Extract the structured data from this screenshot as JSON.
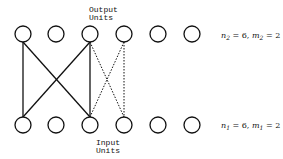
{
  "labels": {
    "output_line1": "Output",
    "output_line2": "Units",
    "input_line1": "Input",
    "input_line2": "Units"
  },
  "equations": {
    "top": {
      "n": "n",
      "n_sub": "2",
      "n_val": " = 6, ",
      "m": "m",
      "m_sub": "2",
      "m_val": " = 2"
    },
    "bottom": {
      "n": "n",
      "n_sub": "1",
      "n_val": " = 6, ",
      "m": "m",
      "m_sub": "1",
      "m_val": " = 2"
    }
  },
  "layers": {
    "output_units": 6,
    "input_units": 6
  },
  "connections": {
    "solid": [
      [
        1,
        1
      ],
      [
        1,
        3
      ],
      [
        3,
        1
      ],
      [
        3,
        3
      ]
    ],
    "dotted": [
      [
        3,
        4
      ],
      [
        4,
        3
      ],
      [
        4,
        4
      ]
    ]
  }
}
